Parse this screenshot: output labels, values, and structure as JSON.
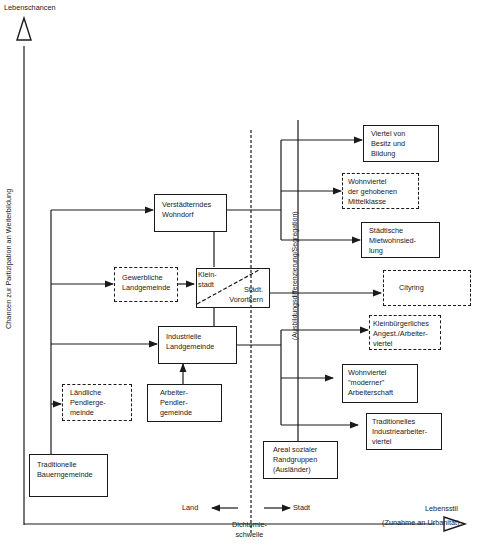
{
  "axes": {
    "y_title": "Lebenschancen",
    "y_label": "Chancen zur Partizipation an Weiterbildung",
    "x_title": "Lebensstil",
    "x_subtitle": "(Zunahme an Urbanität)",
    "land": "Land",
    "stadt": "Stadt",
    "threshold": "Dichtomie-\nschwelle",
    "segregation_label": "(Ausbildungsdifferenzierung/Segregation)"
  },
  "nodes": {
    "traditionelle_bauerngemeinde": "Traditionelle\nBauerngemeinde",
    "laendliche_pendlergemeinde": "Ländliche\nPendlerge-\nmeinde",
    "gewerbliche_landgemeinde": "Gewerbliche\nLandgemeinde",
    "verstaedterndes_wohndorf": "Verstädterndes\nWohndorf",
    "industrielle_landgemeinde": "Industrielle\nLandgemeinde",
    "arbeiter_pendlergemeinde": "Arbeiter-\nPendler-\ngemeinde",
    "kleinstadt": "Klein-\nstadt",
    "staedt_vorortkern": "Städt.\nVorortkern",
    "areal_sozialer_randgruppen": "Areal sozialer\nRandgruppen\n(Ausländer)",
    "viertel_besitz_bildung": "Viertel von\nBesitz und\nBildung",
    "wohnviertel_gehobene_mittelklasse": "Wohnviertel\nder gehobenen\nMittelklasse",
    "staedtische_mietwohnsiedlung": "Städtische\nMietwohnsied-\nlung",
    "cityring": "Cityring",
    "kleinbuergerliches_viertel": "Kleinbürgerliches\nAngest./Arbeiter-\nviertel",
    "wohnviertel_moderner_arbeiterschaft": "Wohnviertel\n\"moderner\"\nArbeiterschaft",
    "traditionelles_industriearbeiterviertel": "Traditionelles\nIndustriearbeiter-\nviertel"
  },
  "colors": {
    "ink": "#1a1a1a",
    "background": "#ffffff"
  }
}
